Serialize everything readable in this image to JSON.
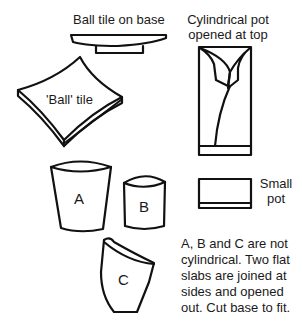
{
  "labels": {
    "ball_tile_on_base": "Ball tile on base",
    "cylindrical_pot_line1": "Cylindrical pot",
    "cylindrical_pot_line2": "opened at top",
    "ball_tile": "'Ball' tile",
    "small_pot_line1": "Small",
    "small_pot_line2": "pot",
    "pot_a": "A",
    "pot_b": "B",
    "pot_c": "C"
  },
  "note": "A, B and C are not cylindrical. Two flat slabs are joined at sides and opened out. Cut base to fit.",
  "figures": [
    {
      "id": "ball-tile-on-base",
      "label": "Ball tile on base"
    },
    {
      "id": "cylindrical-pot",
      "label": "Cylindrical pot opened at top"
    },
    {
      "id": "ball-tile",
      "label": "'Ball' tile"
    },
    {
      "id": "pot-a",
      "label": "A"
    },
    {
      "id": "pot-b",
      "label": "B"
    },
    {
      "id": "pot-c",
      "label": "C"
    },
    {
      "id": "small-pot",
      "label": "Small pot"
    }
  ],
  "colors": {
    "line": "#111111",
    "background": "#ffffff"
  }
}
